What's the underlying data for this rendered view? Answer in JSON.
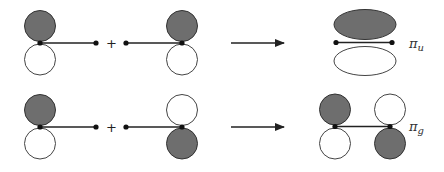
{
  "diagram": {
    "title": "",
    "colors": {
      "shaded_lobe": "#6e6e6e",
      "open_lobe": "#ffffff",
      "stroke": "#222222",
      "label": "#333333"
    },
    "rows": [
      {
        "name": "pi-u-formation",
        "operator": "+",
        "atom_a": {
          "top_lobe": "shaded",
          "bottom_lobe": "open"
        },
        "atom_b": {
          "top_lobe": "shaded",
          "bottom_lobe": "open"
        },
        "result": {
          "shape": "combined ellipses",
          "top_lobe": "shaded",
          "bottom_lobe": "open",
          "label": {
            "symbol": "π",
            "subscript": "u"
          }
        }
      },
      {
        "name": "pi-g-formation",
        "operator": "+",
        "atom_a": {
          "top_lobe": "shaded",
          "bottom_lobe": "open"
        },
        "atom_b": {
          "top_lobe": "open",
          "bottom_lobe": "shaded"
        },
        "result": {
          "shape": "separate p-orbitals",
          "left_atom": {
            "top_lobe": "shaded",
            "bottom_lobe": "open"
          },
          "right_atom": {
            "top_lobe": "open",
            "bottom_lobe": "shaded"
          },
          "label": {
            "symbol": "π",
            "subscript": "g"
          }
        }
      }
    ],
    "arrow_icon": "right-arrow"
  }
}
